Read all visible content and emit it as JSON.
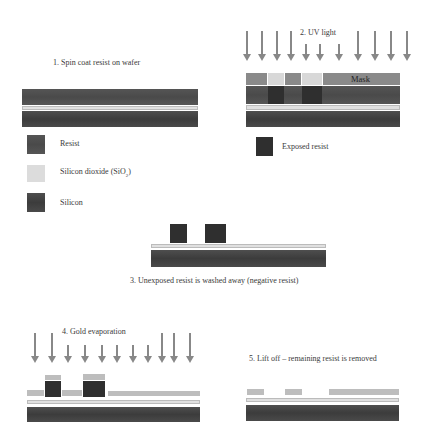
{
  "steps": {
    "step1": "1. Spin coat resist on wafer",
    "step2": "2. UV light",
    "step3": "3. Unexposed resist is washed away (negative resist)",
    "step4": "4. Gold evaporation",
    "step5": "5. Lift off – remaining resist is removed"
  },
  "labels": {
    "mask": "Mask"
  },
  "legend": [
    {
      "label": "Resist",
      "color": "#505050"
    },
    {
      "label": "Silicon dioxide (SiO",
      "sub": "2",
      "suffix": ")",
      "color": "#dcdcdc"
    },
    {
      "label": "Silicon",
      "color": "#444444"
    },
    {
      "label": "Exposed resist",
      "color": "#2f2f2f"
    }
  ],
  "colors": {
    "resist": "#505050",
    "exposed_resist": "#2f2f2f",
    "silicon": "#444444",
    "oxide": "#e0e0e0",
    "gold": "#bdbdbd",
    "mask": "#8a8a8a",
    "arrow": "#888888"
  }
}
